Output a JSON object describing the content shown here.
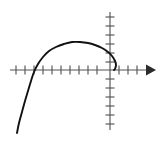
{
  "figure": {
    "title": "",
    "background_color": "#ffffff",
    "width": 157,
    "height": 142
  },
  "chart_data": {
    "type": "line",
    "title": "",
    "subtitle": "",
    "xlabel": "",
    "ylabel": "",
    "grid": false,
    "legend": null,
    "legend_position": "none",
    "axes": {
      "origin_px": [
        110,
        70
      ],
      "x_axis": {
        "name": "x-axis",
        "orientation": "horizontal",
        "start_px": [
          10,
          70
        ],
        "end_px": [
          150,
          70
        ],
        "arrowhead": "right",
        "tick_spacing_px": 9,
        "tick_length_px": 9,
        "tick_positions_px": [
          16,
          25,
          34,
          43,
          52,
          61,
          70,
          79,
          88,
          97,
          110,
          119,
          128,
          137
        ],
        "tick_labels": []
      },
      "y_axis": {
        "name": "y-axis",
        "orientation": "vertical",
        "start_px": [
          110,
          12
        ],
        "end_px": [
          110,
          130
        ],
        "arrowhead": "none",
        "tick_spacing_px": 9,
        "tick_length_px": 9,
        "tick_positions_px": [
          17,
          26,
          35,
          44,
          53,
          62,
          79,
          88,
          97,
          106,
          115,
          124
        ],
        "tick_labels": []
      }
    },
    "series": [
      {
        "name": "curve",
        "color": "#111111",
        "stroke_width": 1.9,
        "closed": false,
        "points_px": [
          [
            17,
            133
          ],
          [
            19,
            123
          ],
          [
            22,
            112
          ],
          [
            25,
            101
          ],
          [
            28,
            91
          ],
          [
            31,
            81
          ],
          [
            34,
            72
          ],
          [
            38,
            64
          ],
          [
            43,
            57
          ],
          [
            49,
            51
          ],
          [
            56,
            47
          ],
          [
            64,
            44
          ],
          [
            72,
            42
          ],
          [
            80,
            42
          ],
          [
            88,
            43
          ],
          [
            95,
            45
          ],
          [
            102,
            48
          ],
          [
            108,
            52
          ],
          [
            112,
            56
          ],
          [
            115,
            61
          ],
          [
            116,
            65
          ],
          [
            115,
            69
          ],
          [
            114,
            70
          ]
        ]
      }
    ],
    "annotations": []
  },
  "style": {
    "axis_color": "#555555",
    "arrow_color": "#2b2b2b",
    "curve_color": "#111111"
  }
}
